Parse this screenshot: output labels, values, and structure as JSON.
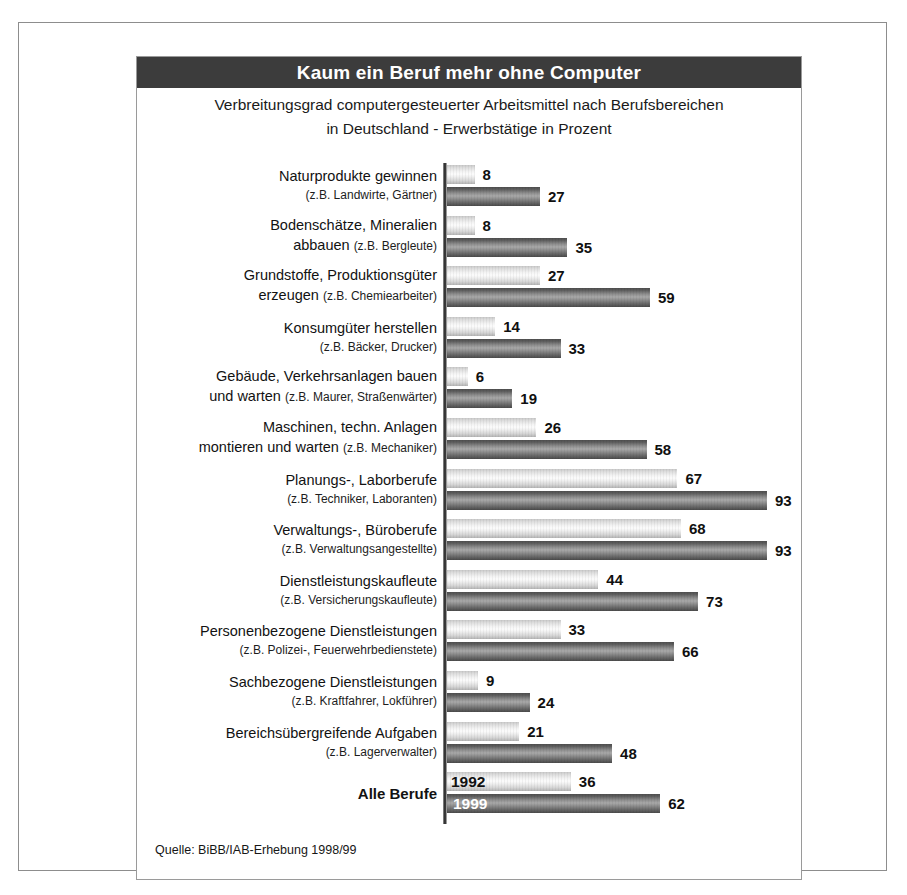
{
  "title": "Kaum ein Beruf mehr ohne Computer",
  "subtitle_line1": "Verbreitungsgrad computergesteuerter Arbeitsmittel nach Berufsbereichen",
  "subtitle_line2": "in Deutschland - Erwerbstätige in Prozent",
  "source": "Quelle: BiBB/IAB-Erhebung 1998/99",
  "colors": {
    "title_bar_background": "#3c3c3c",
    "title_text": "#ffffff",
    "series_1992_bar": "#e9e9e9",
    "series_1999_bar": "#8c8c8c",
    "axis_line": "#343434",
    "frame_border": "#8d8d8d",
    "page_background": "#ffffff"
  },
  "series_captions": {
    "light": "1992",
    "dark": "1999"
  },
  "chart_data": {
    "type": "bar",
    "orientation": "horizontal",
    "title": "Kaum ein Beruf mehr ohne Computer",
    "subtitle": "Verbreitungsgrad computergesteuerter Arbeitsmittel nach Berufsbereichen in Deutschland - Erwerbstätige in Prozent",
    "xlabel": "Erwerbstätige in Prozent",
    "ylabel": "",
    "xlim": [
      0,
      100
    ],
    "grid": false,
    "legend_position": "inline-on-last-group",
    "categories": [
      "Naturprodukte gewinnen",
      "Bodenschätze, Mineralien abbauen",
      "Grundstoffe, Produktionsgüter erzeugen",
      "Konsumgüter herstellen",
      "Gebäude, Verkehrsanlagen bauen und warten",
      "Maschinen, techn. Anlagen montieren und warten",
      "Planungs-, Laborberufe",
      "Verwaltungs-, Büroberufe",
      "Dienstleistungskaufleute",
      "Personenbezogene Dienstleistungen",
      "Sachbezogene Dienstleistungen",
      "Bereichsübergreifende Aufgaben",
      "Alle Berufe"
    ],
    "category_examples": [
      "(z.B. Landwirte, Gärtner)",
      "(z.B. Bergleute)",
      "(z.B. Chemiearbeiter)",
      "(z.B. Bäcker, Drucker)",
      "(z.B. Maurer, Straßenwärter)",
      "(z.B. Mechaniker)",
      "(z.B. Techniker, Laboranten)",
      "(z.B. Verwaltungsangestellte)",
      "(z.B. Versicherungskaufleute)",
      "(z.B. Polizei-, Feuerwehrbedienstete)",
      "(z.B. Kraftfahrer, Lokführer)",
      "(z.B. Lagerverwalter)",
      ""
    ],
    "series": [
      {
        "name": "1992",
        "values": [
          8,
          8,
          27,
          14,
          6,
          26,
          67,
          68,
          44,
          33,
          9,
          21,
          36
        ]
      },
      {
        "name": "1999",
        "values": [
          27,
          35,
          59,
          33,
          19,
          58,
          93,
          93,
          73,
          66,
          24,
          48,
          62
        ]
      }
    ]
  },
  "groups": [
    {
      "label_main": "Naturprodukte gewinnen",
      "label_sub": "(z.B. Landwirte, Gärtner)",
      "inline": false,
      "v1992": "8",
      "v1999": "27"
    },
    {
      "label_main": "Bodenschätze, Mineralien",
      "label_main2": "abbauen",
      "label_sub": "(z.B. Bergleute)",
      "inline": true,
      "v1992": "8",
      "v1999": "35"
    },
    {
      "label_main": "Grundstoffe, Produktionsgüter",
      "label_main2": "erzeugen",
      "label_sub": "(z.B. Chemiearbeiter)",
      "inline": true,
      "v1992": "27",
      "v1999": "59"
    },
    {
      "label_main": "Konsumgüter herstellen",
      "label_sub": "(z.B. Bäcker, Drucker)",
      "inline": false,
      "v1992": "14",
      "v1999": "33"
    },
    {
      "label_main": "Gebäude, Verkehrsanlagen bauen",
      "label_main2": "und warten",
      "label_sub": "(z.B. Maurer, Straßenwärter)",
      "inline": true,
      "v1992": "6",
      "v1999": "19"
    },
    {
      "label_main": "Maschinen, techn. Anlagen",
      "label_main2": "montieren und warten",
      "label_sub": "(z.B. Mechaniker)",
      "inline": true,
      "v1992": "26",
      "v1999": "58"
    },
    {
      "label_main": "Planungs-, Laborberufe",
      "label_sub": "(z.B. Techniker, Laboranten)",
      "inline": false,
      "v1992": "67",
      "v1999": "93"
    },
    {
      "label_main": "Verwaltungs-, Büroberufe",
      "label_sub": "(z.B. Verwaltungsangestellte)",
      "inline": false,
      "v1992": "68",
      "v1999": "93"
    },
    {
      "label_main": "Dienstleistungskaufleute",
      "label_sub": "(z.B. Versicherungskaufleute)",
      "inline": false,
      "v1992": "44",
      "v1999": "73"
    },
    {
      "label_main": "Personenbezogene Dienstleistungen",
      "label_sub": "(z.B. Polizei-, Feuerwehrbedienstete)",
      "inline": false,
      "v1992": "33",
      "v1999": "66"
    },
    {
      "label_main": "Sachbezogene Dienstleistungen",
      "label_sub": "(z.B. Kraftfahrer, Lokführer)",
      "inline": false,
      "v1992": "9",
      "v1999": "24"
    },
    {
      "label_main": "Bereichsübergreifende Aufgaben",
      "label_sub": "(z.B. Lagerverwalter)",
      "inline": false,
      "v1992": "21",
      "v1999": "48"
    },
    {
      "label_main": "Alle Berufe",
      "label_sub": "",
      "inline": false,
      "total": true,
      "v1992": "36",
      "v1999": "62"
    }
  ]
}
